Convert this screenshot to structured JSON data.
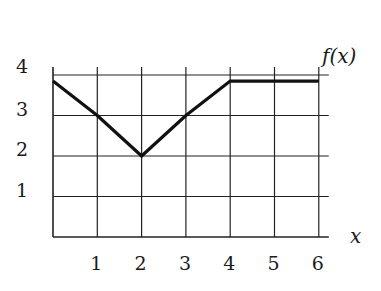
{
  "chart_data": {
    "type": "line",
    "title": "",
    "xlabel": "x",
    "ylabel": "f(x)",
    "x": [
      0,
      1,
      2,
      3,
      4,
      5,
      6
    ],
    "series": [
      {
        "name": "f(x)",
        "values": [
          3.85,
          3,
          2,
          3,
          3.85,
          3.85,
          3.85
        ]
      }
    ],
    "x_ticks": [
      "1",
      "2",
      "3",
      "4",
      "5",
      "6"
    ],
    "y_ticks": [
      "1",
      "2",
      "3",
      "4"
    ],
    "xlim": [
      0,
      6
    ],
    "ylim": [
      0,
      4
    ],
    "grid": true,
    "legend": "none"
  },
  "labels": {
    "function": "f(x)",
    "x_axis": "x"
  },
  "colors": {
    "grid": "#222222",
    "line": "#111111",
    "background": "#ffffff"
  }
}
